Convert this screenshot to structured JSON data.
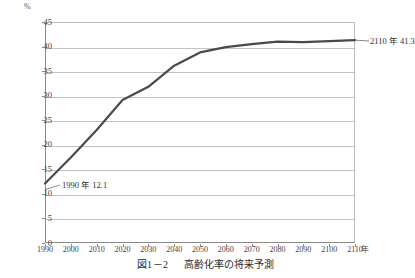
{
  "figure": {
    "caption_number": "図1－2",
    "caption_title": "高齢化率の将来予測"
  },
  "axes": {
    "y_unit": "%",
    "x_unit": "年",
    "y_ticks": [
      "0",
      "5",
      "10",
      "15",
      "20",
      "25",
      "30",
      "35",
      "40",
      "45"
    ],
    "x_ticks": [
      "1990",
      "2000",
      "2010",
      "2020",
      "2030",
      "2040",
      "2050",
      "2060",
      "2070",
      "2080",
      "2090",
      "2100",
      "2110"
    ]
  },
  "annotations": {
    "start": "1990 年 12.1",
    "end": "2110 年 41.3"
  },
  "colors": {
    "line": "#4a4a4a",
    "grid": "#c2c2c2",
    "axis": "#8a8a8a",
    "text": "#3a3a3a"
  },
  "chart_data": {
    "type": "line",
    "title": "高齢化率の将来予測",
    "xlabel": "年",
    "ylabel": "%",
    "xlim": [
      1990,
      2110
    ],
    "ylim": [
      0,
      45
    ],
    "grid": true,
    "legend": false,
    "x": [
      1990,
      2000,
      2010,
      2020,
      2030,
      2040,
      2050,
      2060,
      2070,
      2080,
      2090,
      2100,
      2110
    ],
    "values": [
      12.1,
      17.4,
      23.0,
      29.1,
      31.8,
      36.1,
      38.8,
      39.9,
      40.5,
      41.0,
      40.9,
      41.1,
      41.3
    ],
    "series": [
      {
        "name": "高齢化率",
        "values": [
          12.1,
          17.4,
          23.0,
          29.1,
          31.8,
          36.1,
          38.8,
          39.9,
          40.5,
          41.0,
          40.9,
          41.1,
          41.3
        ]
      }
    ],
    "annotations": [
      {
        "label": "1990 年 12.1",
        "x": 1990,
        "y": 12.1
      },
      {
        "label": "2110 年 41.3",
        "x": 2110,
        "y": 41.3
      }
    ]
  }
}
